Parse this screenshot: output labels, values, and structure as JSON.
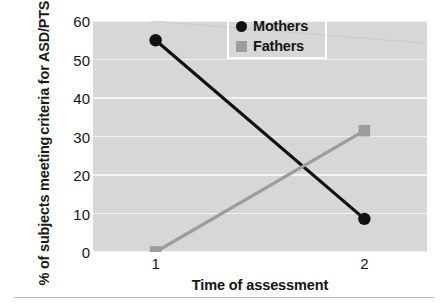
{
  "chart_data": {
    "type": "line",
    "title": "",
    "xlabel": "Time of assessment",
    "ylabel": "% of subjects meeting criteria for ASD/PTSD",
    "ylabel_line1": "% of subjects meeting",
    "ylabel_line2": "criteria for ASD/PTSD",
    "x": [
      1,
      2
    ],
    "categories": [
      "1",
      "2"
    ],
    "xtick_labels": [
      "1",
      "2"
    ],
    "ytick_labels": [
      "0",
      "10",
      "20",
      "30",
      "40",
      "50",
      "60"
    ],
    "yticks": [
      0,
      10,
      20,
      30,
      40,
      50,
      60
    ],
    "ylim": [
      0,
      60
    ],
    "xlim": [
      0.7,
      2.3
    ],
    "grid": "horizontal",
    "legend_position": "top-right",
    "series": [
      {
        "name": "Mothers",
        "values": [
          55,
          8.6
        ],
        "marker": "circle",
        "color": "#111111"
      },
      {
        "name": "Fathers",
        "values": [
          0,
          31.5
        ],
        "marker": "square",
        "color": "#9c9c9c"
      }
    ]
  },
  "legend": {
    "items": [
      {
        "label": "Mothers",
        "marker": "circle-marker-icon"
      },
      {
        "label": "Fathers",
        "marker": "square-marker-icon"
      }
    ]
  },
  "colors": {
    "plot_background": "#d7d7d7",
    "gridline": "#f2f2f2",
    "mothers": "#111111",
    "fathers": "#9c9c9c",
    "text": "#141414"
  }
}
